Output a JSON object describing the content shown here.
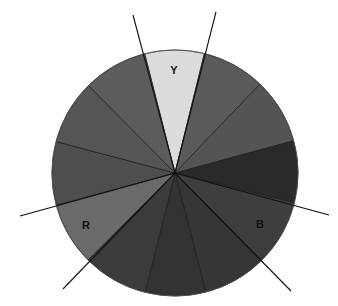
{
  "diagram": {
    "type": "color-wheel",
    "center": [
      175,
      173
    ],
    "radius": 123,
    "segments": [
      {
        "name": "yellow",
        "label": "Y",
        "p1": [
          144,
          51
        ],
        "p2": [
          205,
          51
        ],
        "fill": "#dcdcdc"
      },
      {
        "name": "yellow-orange-right",
        "label": "",
        "p1": [
          205,
          51
        ],
        "p2": [
          260,
          84
        ],
        "fill": "#5a5a5a"
      },
      {
        "name": "right-upper",
        "label": "",
        "p1": [
          260,
          84
        ],
        "p2": [
          293,
          141
        ],
        "fill": "#545454"
      },
      {
        "name": "right-dark",
        "label": "",
        "p1": [
          293,
          141
        ],
        "p2": [
          294,
          203
        ],
        "fill": "#2a2a2a"
      },
      {
        "name": "blue",
        "label": "B",
        "p1": [
          294,
          203
        ],
        "p2": [
          260,
          259
        ],
        "fill": "#3e3e3e"
      },
      {
        "name": "lower-right",
        "label": "",
        "p1": [
          260,
          259
        ],
        "p2": [
          206,
          293
        ],
        "fill": "#363636"
      },
      {
        "name": "bottom",
        "label": "",
        "p1": [
          206,
          293
        ],
        "p2": [
          145,
          293
        ],
        "fill": "#333333"
      },
      {
        "name": "lower-left",
        "label": "",
        "p1": [
          145,
          293
        ],
        "p2": [
          89,
          259
        ],
        "fill": "#3b3b3b"
      },
      {
        "name": "red",
        "label": "R",
        "p1": [
          89,
          259
        ],
        "p2": [
          57,
          205
        ],
        "fill": "#6a6a6a"
      },
      {
        "name": "left",
        "label": "",
        "p1": [
          57,
          205
        ],
        "p2": [
          54,
          141
        ],
        "fill": "#4e4e4e"
      },
      {
        "name": "upper-left",
        "label": "",
        "p1": [
          54,
          141
        ],
        "p2": [
          89,
          86
        ],
        "fill": "#555555"
      },
      {
        "name": "top-left",
        "label": "",
        "p1": [
          89,
          86
        ],
        "p2": [
          144,
          51
        ],
        "fill": "#5c5c5c"
      }
    ],
    "labels": {
      "Y": {
        "text": "Y",
        "x": 174,
        "y": 74
      },
      "R": {
        "text": "R",
        "x": 86,
        "y": 229
      },
      "B": {
        "text": "B",
        "x": 260,
        "y": 228
      }
    },
    "triangle_lines": [
      {
        "name": "line-top-left",
        "from": [
          133,
          15
        ],
        "to": [
          205,
          268
        ]
      },
      {
        "name": "line-top-right",
        "from": [
          216,
          12
        ],
        "to": [
          145,
          293
        ]
      },
      {
        "name": "line-left",
        "from": [
          20,
          216
        ],
        "to": [
          294,
          136
        ]
      },
      {
        "name": "line-right",
        "from": [
          329,
          215
        ],
        "to": [
          57,
          135
        ]
      },
      {
        "name": "line-lower-left",
        "from": [
          63,
          289
        ],
        "to": [
          260,
          84
        ]
      },
      {
        "name": "line-lower-right",
        "from": [
          291,
          291
        ],
        "to": [
          89,
          86
        ]
      }
    ]
  }
}
